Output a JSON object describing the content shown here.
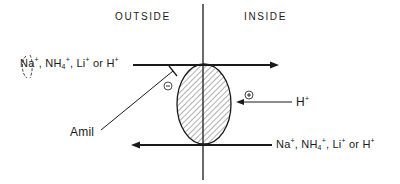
{
  "diagram": {
    "regions": {
      "outside": "OUTSIDE",
      "inside": "INSIDE"
    },
    "top_flux": {
      "ions": [
        {
          "base": "Na",
          "charge": "+",
          "sep": ", "
        },
        {
          "base": "NH",
          "sub": "4",
          "charge": "+",
          "sep": ", "
        },
        {
          "base": "Li",
          "charge": "+",
          "sep": " or "
        },
        {
          "base": "H",
          "charge": "+",
          "sep": ""
        }
      ],
      "direction": "outside-to-inside"
    },
    "bottom_flux": {
      "ions": [
        {
          "base": "Na",
          "charge": "+",
          "sep": ", "
        },
        {
          "base": "NH",
          "sub": "4",
          "charge": "+",
          "sep": ", "
        },
        {
          "base": "Li",
          "charge": "+",
          "sep": " or "
        },
        {
          "base": "H",
          "charge": "+",
          "sep": ""
        }
      ],
      "direction": "inside-to-outside"
    },
    "inhibitor": {
      "label": "Amil",
      "effect_symbol": "−"
    },
    "activator": {
      "label_base": "H",
      "label_charge": "+",
      "effect_symbol": "+"
    },
    "carrier": {
      "fill_pattern": "diagonal-hatch"
    },
    "colors": {
      "ink": "#1a1a1a",
      "background": "#ffffff"
    }
  }
}
